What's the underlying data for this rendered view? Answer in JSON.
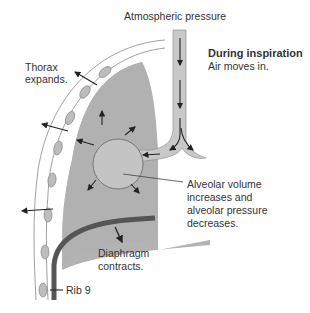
{
  "diagram": {
    "title": "During inspiration",
    "subtitle": "Air moves in.",
    "labels": {
      "atmospheric": "Atmospheric pressure",
      "thorax_line1": "Thorax",
      "thorax_line2": "expands.",
      "alveolar_line1": "Alveolar volume",
      "alveolar_line2": "increases and",
      "alveolar_line3": "alveolar pressure",
      "alveolar_line4": "decreases.",
      "diaphragm_line1": "Diaphragm",
      "diaphragm_line2": "contracts.",
      "rib": "Rib 9"
    },
    "colors": {
      "lung_fill": "#b3b3b3",
      "alveolus_fill": "#c4c4c4",
      "airway_fill": "#c8c8c8",
      "diaphragm": "#555555",
      "rib_fill": "#bdbdbd",
      "text": "#333333"
    }
  }
}
